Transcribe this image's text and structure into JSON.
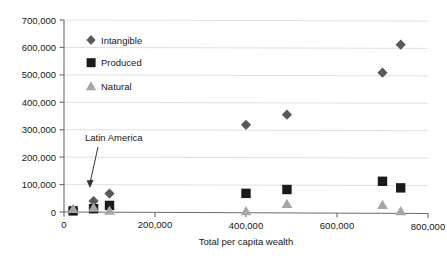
{
  "chart_data": {
    "type": "scatter",
    "title": "",
    "subtitle": "",
    "xlabel": "Total per capita wealth",
    "ylabel": "",
    "xlim": [
      0,
      800000
    ],
    "ylim": [
      0,
      700000
    ],
    "xticks": [
      0,
      200000,
      400000,
      600000,
      800000
    ],
    "xtick_labels": [
      "0",
      "200,000",
      "400,000",
      "600,000",
      "800,000"
    ],
    "yticks": [
      0,
      100000,
      200000,
      300000,
      400000,
      500000,
      600000,
      700000
    ],
    "ytick_labels": [
      "0",
      "100,000",
      "200,000",
      "300,000",
      "400,000",
      "500,000",
      "600,000",
      "700,000"
    ],
    "grid": "horizontal",
    "legend_position": "top-left",
    "series": [
      {
        "name": "Intangible",
        "marker": "diamond",
        "color": "#595959",
        "points": [
          {
            "x": 20000,
            "y": 9000
          },
          {
            "x": 65000,
            "y": 40000
          },
          {
            "x": 100000,
            "y": 67000
          },
          {
            "x": 400000,
            "y": 318000
          },
          {
            "x": 490000,
            "y": 355000
          },
          {
            "x": 700000,
            "y": 508000
          },
          {
            "x": 740000,
            "y": 610000
          }
        ]
      },
      {
        "name": "Produced",
        "marker": "square",
        "color": "#1a1a1a",
        "points": [
          {
            "x": 20000,
            "y": 4000
          },
          {
            "x": 65000,
            "y": 12000
          },
          {
            "x": 100000,
            "y": 24000
          },
          {
            "x": 400000,
            "y": 68000
          },
          {
            "x": 490000,
            "y": 82000
          },
          {
            "x": 700000,
            "y": 112000
          },
          {
            "x": 740000,
            "y": 88000
          }
        ]
      },
      {
        "name": "Natural",
        "marker": "triangle",
        "color": "#a6a6a6",
        "points": [
          {
            "x": 20000,
            "y": 11000
          },
          {
            "x": 65000,
            "y": 16000
          },
          {
            "x": 100000,
            "y": 5000
          },
          {
            "x": 400000,
            "y": 3000
          },
          {
            "x": 490000,
            "y": 30000
          },
          {
            "x": 700000,
            "y": 26000
          },
          {
            "x": 740000,
            "y": 3000
          }
        ]
      }
    ],
    "annotations": [
      {
        "text": "Latin America",
        "target_x": 65000,
        "target_y": 40000
      }
    ]
  },
  "legend": {
    "items": [
      {
        "label": "Intangible"
      },
      {
        "label": "Produced"
      },
      {
        "label": "Natural"
      }
    ]
  },
  "axes": {
    "x_title": "Total per capita wealth"
  }
}
